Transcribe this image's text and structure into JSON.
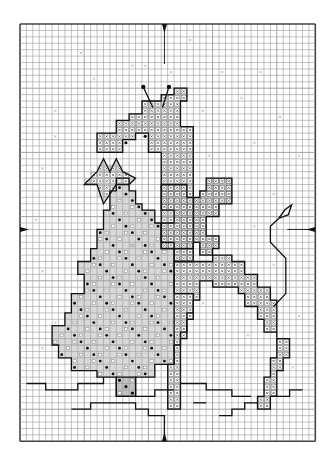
{
  "pattern": {
    "type": "cross-stitch chart",
    "subject": "giraffe with bow beside christmas tree, star and kite",
    "grid": {
      "origin_x": 20,
      "origin_y": 24,
      "cell": 6.42,
      "cols": 46,
      "rows": 65
    },
    "colors": {
      "grid_line": "#9a9a9a",
      "grid_border": "#444444",
      "fill_light": "#d9d9d9",
      "fill_mid": "#c2c2c2",
      "outline": "#111111",
      "symbol": "#333333",
      "background": "#ffffff"
    },
    "center_markers": [
      {
        "name": "top-center-arrow",
        "col": 22.5,
        "row": 0,
        "dir": "down"
      },
      {
        "name": "bottom-center-arrow",
        "col": 22.5,
        "row": 65,
        "dir": "up"
      },
      {
        "name": "left-center-arrow",
        "col": 0,
        "row": 32,
        "dir": "right"
      },
      {
        "name": "right-center-arrow",
        "col": 46,
        "row": 32,
        "dir": "left"
      }
    ],
    "regions": [
      {
        "name": "giraffe-head-neck",
        "fill": "fill_mid",
        "symbol": "x",
        "points": [
          [
            19,
            12
          ],
          [
            22,
            12
          ],
          [
            22,
            11
          ],
          [
            24,
            11
          ],
          [
            24,
            10
          ],
          [
            26,
            10
          ],
          [
            26,
            12
          ],
          [
            25,
            12
          ],
          [
            25,
            16
          ],
          [
            27,
            16
          ],
          [
            27,
            35
          ],
          [
            22,
            35
          ],
          [
            22,
            20
          ],
          [
            20,
            20
          ],
          [
            20,
            17
          ],
          [
            18,
            17
          ],
          [
            18,
            18
          ],
          [
            16,
            18
          ],
          [
            16,
            20
          ],
          [
            12,
            20
          ],
          [
            12,
            17
          ],
          [
            15,
            17
          ],
          [
            15,
            15
          ],
          [
            17,
            15
          ],
          [
            17,
            14
          ],
          [
            19,
            14
          ]
        ]
      },
      {
        "name": "star",
        "fill": "fill_light",
        "symbol": "x",
        "points": [
          [
            15,
            21
          ],
          [
            16,
            23
          ],
          [
            18,
            24
          ],
          [
            17,
            25
          ],
          [
            15,
            25
          ],
          [
            13,
            28
          ],
          [
            12,
            25
          ],
          [
            10,
            25
          ],
          [
            12,
            23
          ],
          [
            13,
            21
          ],
          [
            14,
            23
          ]
        ]
      },
      {
        "name": "christmas-tree",
        "fill": "fill_light",
        "symbol": "dot",
        "points": [
          [
            16,
            24
          ],
          [
            17,
            24
          ],
          [
            17,
            26
          ],
          [
            18,
            26
          ],
          [
            18,
            28
          ],
          [
            19,
            28
          ],
          [
            19,
            29
          ],
          [
            21,
            29
          ],
          [
            21,
            31
          ],
          [
            22,
            31
          ],
          [
            22,
            34
          ],
          [
            24,
            34
          ],
          [
            24,
            42
          ],
          [
            27,
            42
          ],
          [
            27,
            45
          ],
          [
            26,
            45
          ],
          [
            26,
            48
          ],
          [
            25,
            48
          ],
          [
            25,
            50
          ],
          [
            24,
            50
          ],
          [
            24,
            53
          ],
          [
            21,
            53
          ],
          [
            21,
            55
          ],
          [
            18,
            55
          ],
          [
            18,
            58
          ],
          [
            15,
            58
          ],
          [
            15,
            55
          ],
          [
            12,
            55
          ],
          [
            12,
            54
          ],
          [
            8,
            54
          ],
          [
            8,
            52
          ],
          [
            6,
            52
          ],
          [
            6,
            50
          ],
          [
            5,
            50
          ],
          [
            5,
            47
          ],
          [
            7,
            47
          ],
          [
            7,
            45
          ],
          [
            8,
            45
          ],
          [
            8,
            42
          ],
          [
            10,
            42
          ],
          [
            10,
            39
          ],
          [
            9,
            39
          ],
          [
            9,
            37
          ],
          [
            11,
            37
          ],
          [
            11,
            35
          ],
          [
            12,
            35
          ],
          [
            12,
            32
          ],
          [
            13,
            32
          ],
          [
            13,
            29
          ],
          [
            14,
            29
          ],
          [
            14,
            26
          ],
          [
            15,
            26
          ],
          [
            15,
            24
          ]
        ]
      },
      {
        "name": "tree-trunk",
        "fill": "fill_mid",
        "symbol": "dot",
        "points": [
          [
            15,
            55
          ],
          [
            18,
            55
          ],
          [
            18,
            58
          ],
          [
            15,
            58
          ]
        ]
      },
      {
        "name": "giraffe-bow",
        "fill": "fill_light",
        "symbol": "x-dark",
        "points": [
          [
            22,
            25
          ],
          [
            26,
            25
          ],
          [
            26,
            27
          ],
          [
            28,
            27
          ],
          [
            28,
            26
          ],
          [
            29,
            26
          ],
          [
            29,
            24
          ],
          [
            33,
            24
          ],
          [
            33,
            28
          ],
          [
            31,
            28
          ],
          [
            31,
            30
          ],
          [
            29,
            30
          ],
          [
            29,
            33
          ],
          [
            31,
            33
          ],
          [
            31,
            35
          ],
          [
            30,
            35
          ],
          [
            30,
            36
          ],
          [
            28,
            36
          ],
          [
            28,
            34
          ],
          [
            27,
            34
          ],
          [
            27,
            37
          ],
          [
            24,
            37
          ],
          [
            24,
            35
          ],
          [
            22,
            35
          ],
          [
            22,
            31
          ],
          [
            24,
            31
          ],
          [
            24,
            29
          ],
          [
            22,
            29
          ]
        ]
      },
      {
        "name": "giraffe-body",
        "fill": "fill_mid",
        "symbol": "x",
        "points": [
          [
            24,
            37
          ],
          [
            30,
            37
          ],
          [
            30,
            36
          ],
          [
            33,
            36
          ],
          [
            33,
            37
          ],
          [
            35,
            37
          ],
          [
            35,
            39
          ],
          [
            37,
            39
          ],
          [
            37,
            41
          ],
          [
            39,
            41
          ],
          [
            39,
            43
          ],
          [
            40,
            43
          ],
          [
            40,
            49
          ],
          [
            42,
            49
          ],
          [
            42,
            52
          ],
          [
            41,
            52
          ],
          [
            41,
            54
          ],
          [
            40,
            54
          ],
          [
            40,
            58
          ],
          [
            39,
            58
          ],
          [
            39,
            60
          ],
          [
            37,
            60
          ],
          [
            37,
            58
          ],
          [
            38,
            58
          ],
          [
            38,
            55
          ],
          [
            39,
            55
          ],
          [
            39,
            52
          ],
          [
            40,
            52
          ],
          [
            40,
            48
          ],
          [
            38,
            48
          ],
          [
            38,
            46
          ],
          [
            37,
            46
          ],
          [
            37,
            44
          ],
          [
            35,
            44
          ],
          [
            35,
            42
          ],
          [
            34,
            42
          ],
          [
            34,
            41
          ],
          [
            30,
            41
          ],
          [
            30,
            40
          ],
          [
            28,
            40
          ],
          [
            28,
            43
          ],
          [
            27,
            43
          ],
          [
            27,
            46
          ],
          [
            26,
            46
          ],
          [
            26,
            49
          ],
          [
            25,
            49
          ],
          [
            25,
            60
          ],
          [
            23,
            60
          ],
          [
            23,
            53
          ],
          [
            24,
            53
          ],
          [
            24,
            42
          ],
          [
            24,
            37
          ]
        ]
      }
    ],
    "lines": [
      {
        "name": "ossicone-left",
        "points": [
          [
            20.7,
            13
          ],
          [
            19.2,
            9.8
          ]
        ],
        "cap": "dot"
      },
      {
        "name": "ossicone-right",
        "points": [
          [
            22.2,
            13
          ],
          [
            23.2,
            9.8
          ]
        ],
        "cap": "dot"
      },
      {
        "name": "kite",
        "points": [
          [
            40.3,
            30.3
          ],
          [
            41.3,
            28.9
          ],
          [
            42.3,
            28.2
          ],
          [
            41.8,
            29.7
          ],
          [
            40.3,
            30.3
          ]
        ]
      },
      {
        "name": "kite-string",
        "points": [
          [
            40.3,
            30.3
          ],
          [
            39,
            31.5
          ],
          [
            39,
            34
          ],
          [
            41.4,
            36.5
          ],
          [
            41.4,
            42
          ],
          [
            39.5,
            44
          ]
        ]
      },
      {
        "name": "ground-line-left",
        "points": [
          [
            1,
            56
          ],
          [
            4,
            56
          ],
          [
            4,
            57
          ],
          [
            9,
            57
          ],
          [
            9,
            56
          ],
          [
            13,
            56
          ],
          [
            13,
            55
          ]
        ]
      },
      {
        "name": "ground-line-mid",
        "points": [
          [
            8,
            60
          ],
          [
            11,
            60
          ],
          [
            11,
            59
          ],
          [
            18,
            59
          ],
          [
            18,
            60
          ],
          [
            20,
            60
          ],
          [
            20,
            61
          ],
          [
            22.5,
            61
          ],
          [
            22.5,
            65
          ]
        ]
      },
      {
        "name": "ground-line-center",
        "points": [
          [
            18,
            58
          ],
          [
            21,
            58
          ],
          [
            21,
            57
          ],
          [
            24,
            57
          ]
        ]
      },
      {
        "name": "ground-line-right",
        "points": [
          [
            25,
            56
          ],
          [
            29,
            56
          ],
          [
            29,
            57
          ],
          [
            33,
            57
          ],
          [
            33,
            58
          ],
          [
            36,
            58
          ]
        ]
      },
      {
        "name": "ground-line-far-right",
        "points": [
          [
            31,
            61
          ],
          [
            33,
            61
          ],
          [
            33,
            60
          ],
          [
            35,
            60
          ],
          [
            35,
            59
          ],
          [
            37,
            59
          ]
        ]
      },
      {
        "name": "ground-line-edge",
        "points": [
          [
            39,
            58
          ],
          [
            42,
            58
          ],
          [
            42,
            57
          ],
          [
            44,
            57
          ]
        ]
      },
      {
        "name": "hoof-line",
        "points": [
          [
            27,
            59
          ],
          [
            29,
            59
          ]
        ]
      }
    ],
    "scatter_x": [
      [
        9,
        4
      ],
      [
        17,
        6
      ],
      [
        26,
        2
      ],
      [
        31,
        7
      ],
      [
        11,
        8
      ],
      [
        23,
        7
      ],
      [
        37,
        7
      ],
      [
        34,
        11
      ],
      [
        19,
        6
      ],
      [
        5,
        13
      ],
      [
        28,
        13
      ],
      [
        40,
        14
      ],
      [
        36,
        18
      ],
      [
        5,
        17
      ],
      [
        29,
        20
      ],
      [
        43,
        20
      ],
      [
        3,
        22
      ],
      [
        32,
        24
      ],
      [
        39,
        26
      ],
      [
        2,
        30
      ],
      [
        36,
        31
      ],
      [
        26,
        33
      ],
      [
        17,
        34
      ],
      [
        39,
        37
      ],
      [
        3,
        38
      ],
      [
        43,
        45
      ],
      [
        30,
        40
      ],
      [
        42,
        53
      ],
      [
        28,
        43
      ],
      [
        33,
        40
      ],
      [
        3,
        50
      ],
      [
        5,
        46
      ],
      [
        35,
        48
      ]
    ],
    "scatter_star": [
      [
        19,
        17
      ],
      [
        16,
        18
      ]
    ]
  }
}
